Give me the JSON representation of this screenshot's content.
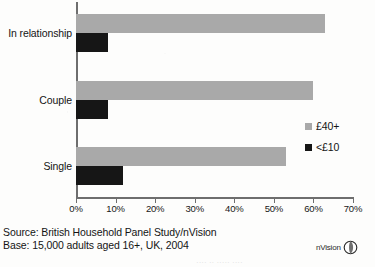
{
  "chart_data": {
    "type": "bar",
    "orientation": "horizontal",
    "title": "",
    "xlabel": "",
    "ylabel": "",
    "categories": [
      "In relationship",
      "Couple",
      "Single"
    ],
    "series": [
      {
        "name": "£40+",
        "color": "#a9a9a9",
        "values": [
          63,
          60,
          53
        ]
      },
      {
        "name": "<£10",
        "color": "#161616",
        "values": [
          8,
          8,
          12
        ]
      }
    ],
    "xlim": [
      0,
      70
    ],
    "xticks": [
      0,
      10,
      20,
      30,
      40,
      50,
      60,
      70
    ],
    "xticklabels": [
      "0%",
      "10%",
      "20%",
      "30%",
      "40%",
      "50%",
      "60%",
      "70%"
    ],
    "grid": false,
    "legend_position": "right"
  },
  "legend": {
    "items": [
      {
        "label": "£40+",
        "color": "#a9a9a9"
      },
      {
        "label": "<£10",
        "color": "#161616"
      }
    ]
  },
  "footer": {
    "source": "Source: British Household Panel Study/nVision",
    "base": "Base: 15,000 adults aged 16+, UK, 2004",
    "logo_text": "nVision",
    "cut_text": "···· ·· ····· ····"
  }
}
